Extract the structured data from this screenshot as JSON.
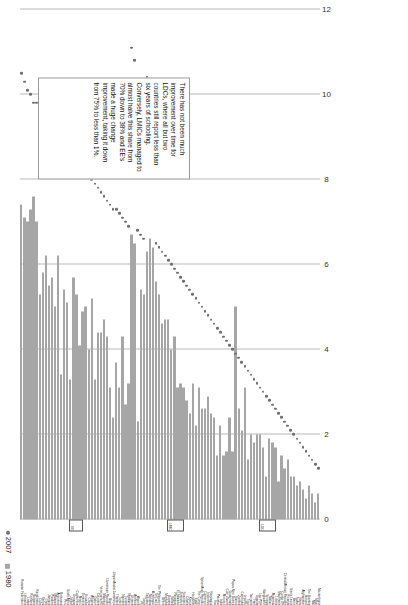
{
  "caption": {
    "text": "Average number of years of schooling for adults over 25 years of age, 1980–2007. (Note: EE emerging economy,"
  },
  "legend": {
    "items": [
      {
        "label": "1980",
        "marker": "square-swatch",
        "color": "#a6a6a6"
      },
      {
        "label": "2007",
        "marker": "dot",
        "color": "#6f6f6f"
      }
    ]
  },
  "annotation": {
    "text": "There has not been much improvement over time for LDCs, where all but two countries still report less than six years of schooling. Conversely, LMICs managed to almost halve this share from 70% down to 38% and EE's made a huge change improvement, taking it down from 75% to less than 1%."
  },
  "group_markers": [
    {
      "label": "EE"
    },
    {
      "label": "LMIC"
    },
    {
      "label": "LDC"
    }
  ],
  "chart_data": {
    "type": "bar",
    "title": "",
    "subtitle": "",
    "xlabel": "",
    "ylabel": "",
    "orientation": "horizontal",
    "xlim": [
      0,
      12
    ],
    "xticks": [
      0,
      2,
      4,
      6,
      8,
      10,
      12
    ],
    "grid": true,
    "legend_position": "top-left",
    "series": [
      {
        "name": "1980",
        "type": "bar",
        "color": "#a6a6a6"
      },
      {
        "name": "2007",
        "type": "dot",
        "color": "#6f6f6f"
      }
    ],
    "categories": [
      "Russian Federation",
      "Lithuania",
      "Latvia",
      "Romania",
      "Bulgaria",
      "Kazakhstan",
      "Cuba",
      "Serbia",
      "Chile",
      "Jamaica",
      "Panama",
      "Malaysia",
      "Argentina",
      "Botswana",
      "Peru",
      "South Africa",
      "Jordan",
      "Uruguay",
      "Costa Rica",
      "Mexico",
      "Dominica",
      "Ecuador",
      "China",
      "Albania",
      "Gabon",
      "Colombia",
      "Venezuela RB",
      "Mauritius",
      "Dominican Republic",
      "Brazil",
      "Libyan Arabic Jamahiriya",
      "Thailand",
      "Turkey",
      "Namibia",
      "Tunisia",
      "Maldives",
      "Ukraine",
      "Armenia",
      "Algeria",
      "Fiji",
      "Tonga",
      "Tajikistan",
      "Moldova",
      "Azerbaijan",
      "Sri Lanka",
      "The Philippines",
      "Belize",
      "Mongolia",
      "Guyana",
      "Bolivia",
      "Paraguay",
      "El Salvador",
      "Zimbabwe",
      "Swaziland",
      "Ghana",
      "Kenya",
      "Honduras",
      "Egypt",
      "The Congo",
      "Syrian Arab Republic",
      "Cameroon",
      "Indonesia",
      "Nicaragua",
      "Iraq",
      "Pakistan",
      "India",
      "Morocco",
      "Cote d'Ivoire",
      "Guatemala",
      "Papua New Guinea",
      "Samoa",
      "Zambia",
      "Cambodia",
      "Lesotho",
      "Togo",
      "Tanzania",
      "Haiti",
      "Uganda",
      "Lao PDR",
      "Bangladesh",
      "Senegal",
      "Malawi",
      "Myanmar",
      "Liberia",
      "Mauritania",
      "Congo DR",
      "Central African Republic",
      "Rwanda",
      "Sierra Leone",
      "Benin",
      "Sudan",
      "Nepal",
      "Afghanistan",
      "Burundi",
      "The Gambia",
      "Mali",
      "Niger",
      "Mozambique"
    ],
    "values_1980": [
      7.4,
      7.1,
      7.0,
      7.3,
      7.6,
      7.0,
      5.3,
      5.8,
      6.2,
      5.5,
      5.7,
      5.0,
      6.2,
      3.4,
      5.4,
      5.1,
      3.3,
      5.7,
      5.3,
      4.1,
      4.9,
      5.0,
      4.0,
      5.2,
      3.3,
      4.4,
      4.4,
      4.7,
      4.3,
      3.1,
      2.4,
      3.7,
      3.1,
      4.3,
      2.7,
      3.2,
      6.7,
      6.5,
      2.3,
      5.4,
      5.3,
      6.3,
      6.6,
      6.4,
      5.6,
      5.3,
      4.6,
      4.7,
      4.7,
      4.0,
      4.3,
      3.1,
      3.2,
      3.1,
      2.8,
      2.5,
      3.2,
      2.2,
      3.1,
      2.6,
      2.6,
      2.9,
      2.5,
      2.4,
      1.5,
      2.2,
      1.5,
      1.6,
      2.4,
      1.6,
      5.0,
      2.6,
      2.1,
      3.1,
      1.4,
      2.0,
      1.8,
      2.0,
      2.0,
      1.7,
      1.0,
      1.9,
      1.8,
      1.7,
      0.9,
      1.5,
      1.2,
      1.4,
      1.0,
      1.0,
      0.8,
      0.9,
      0.7,
      0.5,
      0.8,
      0.6,
      0.4,
      0.6
    ],
    "values_2007": [
      10.5,
      10.3,
      10.1,
      10.0,
      9.8,
      9.8,
      9.6,
      9.5,
      9.4,
      9.2,
      9.1,
      9.0,
      8.9,
      8.9,
      8.8,
      8.7,
      8.6,
      8.6,
      8.5,
      8.4,
      8.3,
      8.2,
      8.1,
      8.0,
      7.9,
      7.8,
      7.7,
      7.6,
      7.5,
      7.4,
      7.3,
      7.3,
      7.2,
      7.1,
      7.0,
      6.9,
      11.1,
      10.8,
      6.8,
      6.7,
      6.6,
      10.4,
      10.2,
      9.9,
      6.5,
      6.4,
      6.3,
      6.2,
      6.1,
      6.0,
      5.9,
      5.8,
      5.7,
      5.6,
      5.5,
      5.4,
      5.3,
      5.2,
      5.1,
      5.0,
      4.9,
      4.8,
      4.7,
      4.6,
      4.5,
      4.4,
      4.3,
      4.2,
      4.1,
      4.0,
      3.9,
      3.8,
      3.7,
      3.6,
      3.5,
      3.4,
      3.3,
      3.2,
      3.1,
      3.0,
      2.9,
      2.8,
      2.7,
      2.6,
      2.5,
      2.4,
      2.3,
      2.2,
      2.1,
      2.0,
      1.9,
      1.8,
      1.7,
      1.6,
      1.5,
      1.4,
      1.3,
      1.2
    ]
  }
}
